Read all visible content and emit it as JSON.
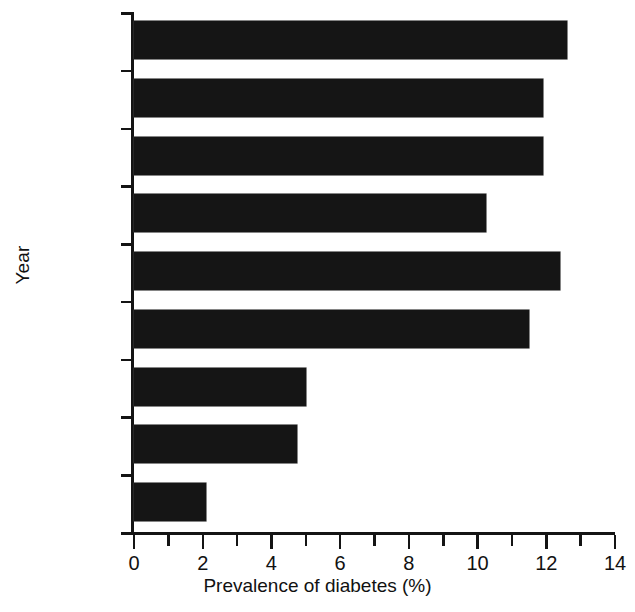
{
  "chart_data": {
    "type": "bar",
    "orientation": "horizontal",
    "title": "",
    "xlabel": "Prevalence of diabetes (%)",
    "ylabel": "Year",
    "xlim": [
      0,
      14
    ],
    "ylim": null,
    "grid": false,
    "legend": null,
    "bar_color": "#151515",
    "categories": [
      "2003²⁹",
      "2001¹⁹",
      "2001²⁰",
      "2001²⁸",
      "2000²⁷",
      "1999²⁶",
      "1988²⁵",
      "1904²⁴",
      "1972¹⁶"
    ],
    "category_parts": [
      {
        "base": "2003",
        "sup": "29"
      },
      {
        "base": "2001",
        "sup": "19"
      },
      {
        "base": "2001",
        "sup": "20"
      },
      {
        "base": "2001",
        "sup": "28"
      },
      {
        "base": "2000",
        "sup": "27"
      },
      {
        "base": "1999",
        "sup": "26"
      },
      {
        "base": "1988",
        "sup": "25"
      },
      {
        "base": "1904",
        "sup": "24"
      },
      {
        "base": "1972",
        "sup": "16"
      }
    ],
    "values": [
      12.6,
      11.9,
      11.9,
      10.25,
      12.4,
      11.5,
      5.0,
      4.75,
      2.1
    ],
    "xticks": [
      0,
      2,
      4,
      6,
      8,
      10,
      12,
      14
    ],
    "xticklabels": [
      "0",
      "2",
      "4",
      "6",
      "8",
      "10",
      "12",
      "14"
    ],
    "xminorticks": [
      1,
      3,
      5,
      7,
      9,
      11,
      13
    ]
  },
  "axes": {
    "x_title": "Prevalence of diabetes (%)",
    "y_title": "Year"
  }
}
